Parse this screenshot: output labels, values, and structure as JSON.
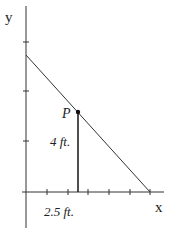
{
  "diagram": {
    "axes": {
      "x_label": "x",
      "y_label": "y"
    },
    "point": {
      "label": "P"
    },
    "height_label": "4 ft.",
    "distance_label": "2.5 ft.",
    "colors": {
      "stroke": "#333333",
      "text": "#222222"
    }
  }
}
